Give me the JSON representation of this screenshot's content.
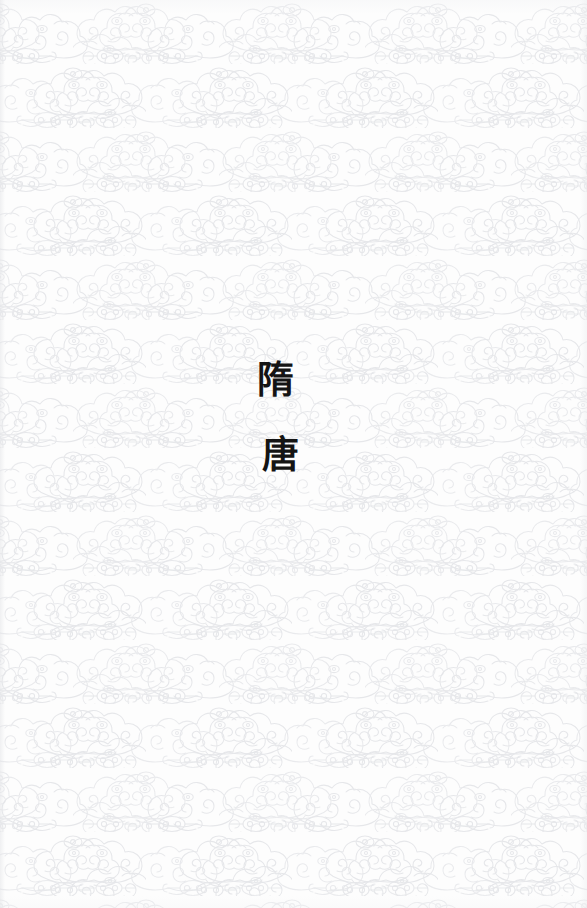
{
  "page": {
    "kind": "book-section-divider",
    "width": 587,
    "height": 908,
    "background_color": "#fdfdfd",
    "pattern_line_color": "#e6e7ea",
    "text_color": "#141414"
  },
  "background": {
    "motif_name": "auspicious-cloud-pattern",
    "motif_label": "祥云",
    "description_visible": false
  },
  "title": {
    "lines": [
      {
        "char": "隋",
        "name": "sui"
      },
      {
        "char": "唐",
        "name": "tang"
      }
    ],
    "line_1": "隋",
    "line_2": "唐"
  }
}
